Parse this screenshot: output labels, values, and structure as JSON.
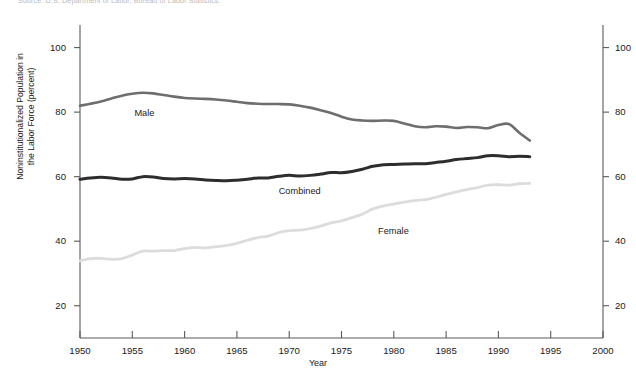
{
  "source_note": "Source: U.S. Department of Labor, Bureau of Labor Statistics.",
  "chart_data": {
    "type": "line",
    "title": "",
    "xlabel": "Year",
    "ylabel": "Nonninstitutionalized Population in the Labor Force (percent)",
    "ylabel_line1": "Noninstitutionalized Population in",
    "ylabel_line2": "the Labor Force (percent)",
    "xlim": [
      1950,
      2000
    ],
    "ylim": [
      10,
      107
    ],
    "grid": false,
    "legend": "inline-labels",
    "xticks": [
      1950,
      1955,
      1960,
      1965,
      1970,
      1975,
      1980,
      1985,
      1990,
      1995,
      2000
    ],
    "yticks": [
      20,
      40,
      60,
      80,
      100
    ],
    "yticks_right": [
      20,
      40,
      60,
      80,
      100
    ],
    "x": [
      1950,
      1951,
      1952,
      1953,
      1954,
      1955,
      1956,
      1957,
      1958,
      1959,
      1960,
      1961,
      1962,
      1963,
      1964,
      1965,
      1966,
      1967,
      1968,
      1969,
      1970,
      1971,
      1972,
      1973,
      1974,
      1975,
      1976,
      1977,
      1978,
      1979,
      1980,
      1981,
      1982,
      1983,
      1984,
      1985,
      1986,
      1987,
      1988,
      1989,
      1990,
      1991,
      1992,
      1993
    ],
    "series": [
      {
        "name": "Male",
        "color": "#6e6e6e",
        "width": 2.6,
        "label_x": 1955.2,
        "label_y": 79.5,
        "values": [
          82.0,
          82.6,
          83.3,
          84.2,
          85.1,
          85.7,
          86.0,
          85.8,
          85.3,
          84.8,
          84.4,
          84.2,
          84.1,
          83.9,
          83.6,
          83.2,
          82.8,
          82.6,
          82.5,
          82.5,
          82.4,
          82.0,
          81.4,
          80.6,
          79.7,
          78.6,
          77.7,
          77.4,
          77.3,
          77.4,
          77.3,
          76.5,
          75.6,
          75.3,
          75.6,
          75.5,
          75.1,
          75.4,
          75.3,
          75.0,
          76.0,
          76.3,
          73.6,
          71.2
        ]
      },
      {
        "name": "Combined",
        "color": "#2d2d2d",
        "width": 3.0,
        "label_x": 1969.0,
        "label_y": 55.3,
        "values": [
          59.2,
          59.6,
          59.8,
          59.6,
          59.2,
          59.3,
          60.0,
          59.9,
          59.4,
          59.3,
          59.4,
          59.3,
          59.0,
          58.8,
          58.7,
          58.9,
          59.2,
          59.6,
          59.6,
          60.1,
          60.4,
          60.2,
          60.4,
          60.8,
          61.3,
          61.2,
          61.6,
          62.3,
          63.2,
          63.7,
          63.8,
          63.9,
          64.0,
          64.0,
          64.4,
          64.8,
          65.3,
          65.6,
          65.9,
          66.5,
          66.5,
          66.2,
          66.3,
          66.2
        ]
      },
      {
        "name": "Female",
        "color": "#dcdcdc",
        "width": 2.8,
        "label_x": 1978.5,
        "label_y": 43.0,
        "values": [
          33.9,
          34.6,
          34.7,
          34.4,
          34.6,
          35.7,
          36.9,
          36.9,
          37.1,
          37.1,
          37.7,
          38.1,
          37.9,
          38.3,
          38.7,
          39.3,
          40.3,
          41.1,
          41.6,
          42.7,
          43.3,
          43.4,
          43.9,
          44.7,
          45.7,
          46.3,
          47.3,
          48.4,
          50.0,
          50.9,
          51.5,
          52.1,
          52.6,
          52.9,
          53.6,
          54.5,
          55.3,
          56.0,
          56.6,
          57.4,
          57.5,
          57.4,
          57.8,
          57.9
        ]
      }
    ]
  }
}
